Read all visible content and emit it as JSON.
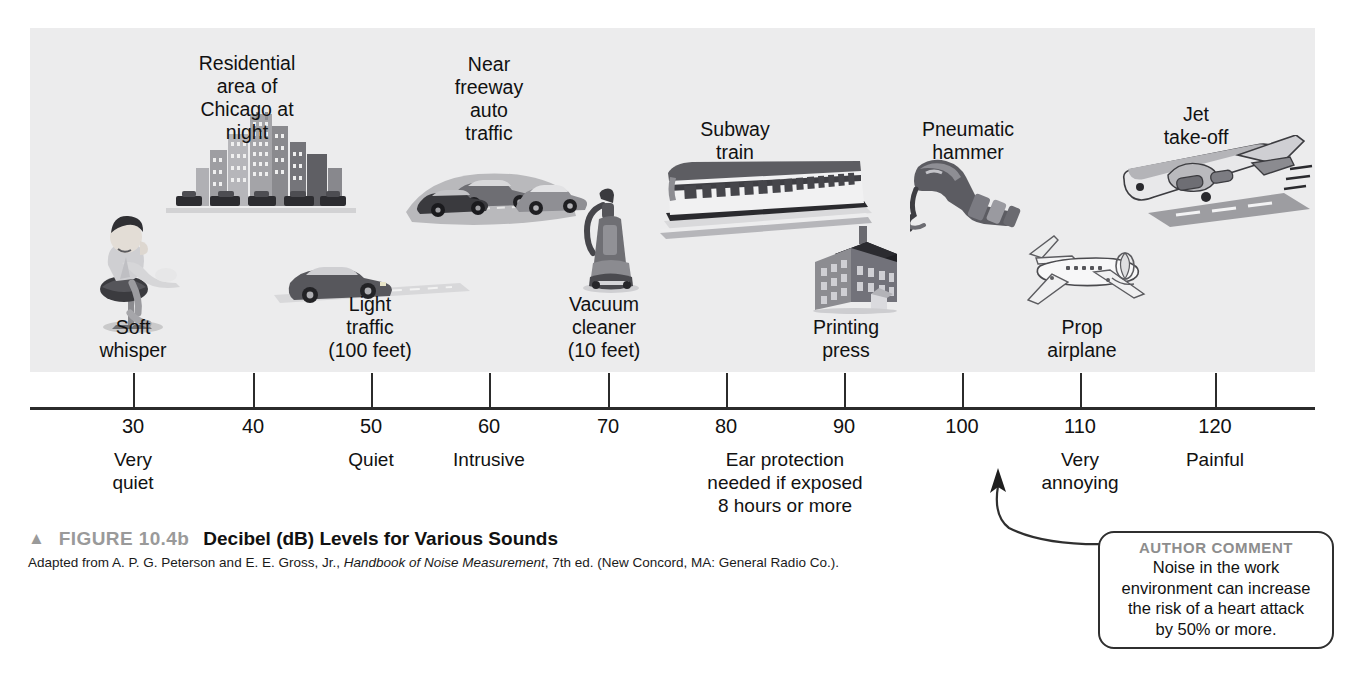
{
  "figure": {
    "triangle_marker": "▲",
    "figure_number": "FIGURE 10.4b",
    "title": "Decibel (dB) Levels for Various Sounds",
    "source_prefix": "Adapted from A. P. G. Peterson and E. E. Gross, Jr., ",
    "source_italic": "Handbook of Noise Measurement",
    "source_suffix": ", 7th ed. (New Concord, MA: General Radio Co.)."
  },
  "author_comment": {
    "heading": "AUTHOR COMMENT",
    "line1": "Noise in the work",
    "line2": "environment can increase",
    "line3": "the risk of a heart attack",
    "line4": "by 50% or more."
  },
  "chart_data": {
    "type": "scatter",
    "title": "Decibel (dB) Levels for Various Sounds",
    "xlabel": "",
    "ylabel": "",
    "xlim": [
      25,
      125
    ],
    "grid": false,
    "legend": "none",
    "tick_values": [
      30,
      40,
      50,
      60,
      70,
      80,
      90,
      100,
      110,
      120
    ],
    "tick_labels": [
      "30",
      "40",
      "50",
      "60",
      "70",
      "80",
      "90",
      "100",
      "110",
      "120"
    ],
    "categories": [
      "Soft whisper",
      "Residential area of Chicago at night",
      "Light traffic (100 feet)",
      "Near freeway auto traffic",
      "Vacuum cleaner (10 feet)",
      "Subway train",
      "Printing press",
      "Pneumatic hammer",
      "Prop airplane",
      "Jet take-off"
    ],
    "values": [
      30,
      40,
      50,
      60,
      70,
      80,
      90,
      100,
      110,
      120
    ],
    "zone_annotations": [
      {
        "label": "Very quiet",
        "db": 30
      },
      {
        "label": "Quiet",
        "db": 50
      },
      {
        "label": "Intrusive",
        "db": 60
      },
      {
        "label": "Ear protection needed if exposed 8 hours or more",
        "db": 85
      },
      {
        "label": "Very annoying",
        "db": 110
      },
      {
        "label": "Painful",
        "db": 120
      }
    ]
  },
  "scale": {
    "ticks": [
      {
        "value": "30",
        "x": 133
      },
      {
        "value": "40",
        "x": 253
      },
      {
        "value": "50",
        "x": 371
      },
      {
        "value": "60",
        "x": 489
      },
      {
        "value": "70",
        "x": 608
      },
      {
        "value": "80",
        "x": 726
      },
      {
        "value": "90",
        "x": 844
      },
      {
        "value": "100",
        "x": 962
      },
      {
        "value": "110",
        "x": 1080
      },
      {
        "value": "120",
        "x": 1215
      }
    ]
  },
  "zones": [
    {
      "name": "zone-very-quiet",
      "x": 133,
      "lines": [
        "Very",
        "quiet"
      ]
    },
    {
      "name": "zone-quiet",
      "x": 371,
      "lines": [
        "Quiet"
      ]
    },
    {
      "name": "zone-intrusive",
      "x": 489,
      "lines": [
        "Intrusive"
      ]
    },
    {
      "name": "zone-ear-protection",
      "x": 785,
      "lines": [
        "Ear protection",
        "needed if exposed",
        "8 hours or more"
      ]
    },
    {
      "name": "zone-very-annoying",
      "x": 1080,
      "lines": [
        "Very",
        "annoying"
      ]
    },
    {
      "name": "zone-painful",
      "x": 1215,
      "lines": [
        "Painful"
      ]
    }
  ],
  "sources": [
    {
      "name": "label-soft-whisper",
      "icon": "person-whispering-icon",
      "x": 133,
      "y": 316,
      "lines": [
        "Soft",
        "whisper"
      ]
    },
    {
      "name": "label-residential-chicago",
      "icon": "city-skyline-icon",
      "x": 247,
      "y": 52,
      "lines": [
        "Residential",
        "area of",
        "Chicago at",
        "night"
      ]
    },
    {
      "name": "label-light-traffic",
      "icon": "car-icon",
      "x": 370,
      "y": 293,
      "lines": [
        "Light",
        "traffic",
        "(100 feet)"
      ]
    },
    {
      "name": "label-near-freeway",
      "icon": "freeway-cars-icon",
      "x": 489,
      "y": 53,
      "lines": [
        "Near",
        "freeway",
        "auto",
        "traffic"
      ]
    },
    {
      "name": "label-vacuum-cleaner",
      "icon": "vacuum-cleaner-icon",
      "x": 604,
      "y": 293,
      "lines": [
        "Vacuum",
        "cleaner",
        "(10 feet)"
      ]
    },
    {
      "name": "label-subway-train",
      "icon": "subway-train-icon",
      "x": 735,
      "y": 118,
      "lines": [
        "Subway",
        "train"
      ]
    },
    {
      "name": "label-printing-press",
      "icon": "factory-building-icon",
      "x": 846,
      "y": 316,
      "lines": [
        "Printing",
        "press"
      ]
    },
    {
      "name": "label-pneumatic-hammer",
      "icon": "pneumatic-hammer-icon",
      "x": 968,
      "y": 118,
      "lines": [
        "Pneumatic",
        "hammer"
      ]
    },
    {
      "name": "label-prop-airplane",
      "icon": "prop-airplane-icon",
      "x": 1082,
      "y": 316,
      "lines": [
        "Prop",
        "airplane"
      ]
    },
    {
      "name": "label-jet-takeoff",
      "icon": "jet-takeoff-icon",
      "x": 1196,
      "y": 103,
      "lines": [
        "Jet",
        "take-off"
      ]
    }
  ]
}
